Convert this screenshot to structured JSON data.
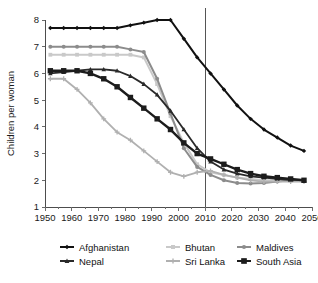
{
  "chart_data": {
    "type": "line",
    "title": "",
    "xlabel": "",
    "ylabel": "Children per woman",
    "xlim": [
      1950,
      2050
    ],
    "ylim": [
      1,
      8
    ],
    "grid": false,
    "legend_position": "bottom",
    "x_ticks": [
      1950,
      1960,
      1970,
      1980,
      1990,
      2000,
      2010,
      2020,
      2030,
      2040,
      2050
    ],
    "y_ticks": [
      1,
      2,
      3,
      4,
      5,
      6,
      7,
      8
    ],
    "annotations": [
      {
        "name": "projection-divider",
        "type": "vline",
        "x": 2010
      }
    ],
    "x": [
      1952,
      1957,
      1962,
      1967,
      1972,
      1977,
      1982,
      1987,
      1992,
      1997,
      2002,
      2007,
      2012,
      2017,
      2022,
      2027,
      2032,
      2037,
      2042,
      2047
    ],
    "series": [
      {
        "name": "Afghanistan",
        "color": "#111111",
        "marker": "diamond",
        "width": 2.0,
        "values": [
          7.7,
          7.7,
          7.7,
          7.7,
          7.7,
          7.7,
          7.8,
          7.9,
          8.0,
          8.0,
          7.3,
          6.6,
          6.0,
          5.4,
          4.8,
          4.3,
          3.9,
          3.6,
          3.3,
          3.1
        ]
      },
      {
        "name": "Bhutan",
        "color": "#c9c9c9",
        "marker": "square",
        "width": 2.0,
        "values": [
          6.7,
          6.7,
          6.7,
          6.7,
          6.7,
          6.7,
          6.7,
          6.6,
          5.6,
          4.4,
          3.4,
          2.6,
          2.3,
          2.2,
          2.1,
          2.05,
          2.0,
          2.0,
          2.0,
          2.0
        ]
      },
      {
        "name": "Maldives",
        "color": "#8c8c8c",
        "marker": "circle",
        "width": 2.0,
        "values": [
          7.0,
          7.0,
          7.0,
          7.0,
          7.0,
          7.0,
          6.9,
          6.8,
          5.8,
          4.5,
          3.2,
          2.5,
          2.2,
          2.0,
          1.9,
          1.88,
          1.9,
          1.95,
          2.0,
          2.0
        ]
      },
      {
        "name": "Nepal",
        "color": "#2a2a2a",
        "marker": "triangle",
        "width": 1.8,
        "values": [
          6.0,
          6.05,
          6.1,
          6.15,
          6.15,
          6.1,
          5.9,
          5.6,
          5.2,
          4.6,
          3.9,
          3.2,
          2.7,
          2.4,
          2.25,
          2.15,
          2.1,
          2.05,
          2.0,
          2.0
        ]
      },
      {
        "name": "Sri Lanka",
        "color": "#b0b0b0",
        "marker": "plus",
        "width": 1.8,
        "values": [
          5.8,
          5.8,
          5.4,
          4.9,
          4.3,
          3.8,
          3.5,
          3.1,
          2.7,
          2.3,
          2.15,
          2.3,
          2.35,
          2.2,
          2.1,
          2.0,
          1.95,
          1.95,
          1.95,
          1.95
        ]
      },
      {
        "name": "South Asia",
        "color": "#1c1c1c",
        "marker": "bigsquare",
        "width": 2.4,
        "values": [
          6.1,
          6.1,
          6.1,
          6.0,
          5.8,
          5.5,
          5.1,
          4.7,
          4.3,
          3.9,
          3.4,
          3.0,
          2.8,
          2.6,
          2.4,
          2.25,
          2.15,
          2.1,
          2.05,
          2.0
        ]
      }
    ]
  },
  "legend": {
    "entries": [
      {
        "label": "Afghanistan",
        "color": "#111111",
        "marker": "diamond"
      },
      {
        "label": "Bhutan",
        "color": "#c9c9c9",
        "marker": "square"
      },
      {
        "label": "Maldives",
        "color": "#8c8c8c",
        "marker": "circle"
      },
      {
        "label": "Nepal",
        "color": "#2a2a2a",
        "marker": "triangle"
      },
      {
        "label": "Sri Lanka",
        "color": "#b0b0b0",
        "marker": "plus"
      },
      {
        "label": "South Asia",
        "color": "#1c1c1c",
        "marker": "bigsquare"
      }
    ]
  },
  "colors": {
    "background": "#ffffff",
    "axis": "#4d4d4d",
    "text": "#1a1a1a",
    "divider": "#555555"
  }
}
